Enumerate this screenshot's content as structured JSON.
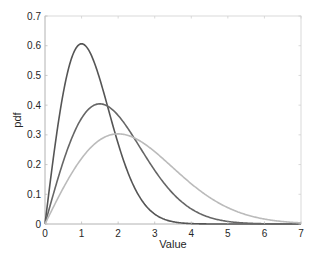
{
  "chart_data": {
    "type": "line",
    "title": "",
    "xlabel": "Value",
    "ylabel": "pdf",
    "xlim": [
      0,
      7
    ],
    "ylim": [
      0,
      0.7
    ],
    "xticks": [
      0,
      1,
      2,
      3,
      4,
      5,
      6,
      7
    ],
    "yticks": [
      0,
      0.1,
      0.2,
      0.3,
      0.4,
      0.5,
      0.6,
      0.7
    ],
    "grid": false,
    "legend": null,
    "series": [
      {
        "name": "Rayleigh b=1",
        "color": "#555555",
        "x": [
          0,
          0.25,
          0.5,
          0.75,
          1.0,
          1.25,
          1.5,
          1.75,
          2.0,
          2.5,
          3.0,
          3.5,
          4.0,
          5.0,
          6.0,
          7.0
        ],
        "values": [
          0,
          0.242,
          0.441,
          0.567,
          0.607,
          0.572,
          0.487,
          0.379,
          0.271,
          0.11,
          0.033,
          0.008,
          0.001,
          0.0,
          0.0,
          0.0
        ]
      },
      {
        "name": "Rayleigh b=1.5",
        "color": "#666666",
        "x": [
          0,
          0.5,
          1.0,
          1.5,
          2.0,
          2.5,
          3.0,
          3.5,
          4.0,
          4.5,
          5.0,
          6.0,
          7.0
        ],
        "values": [
          0,
          0.211,
          0.356,
          0.404,
          0.366,
          0.278,
          0.18,
          0.1,
          0.051,
          0.015,
          0.009,
          0.001,
          0.0
        ]
      },
      {
        "name": "Rayleigh b=2",
        "color": "#bbbbbb",
        "x": [
          0,
          0.5,
          1.0,
          1.5,
          2.0,
          2.5,
          3.0,
          3.5,
          4.0,
          4.5,
          5.0,
          5.5,
          6.0,
          6.5,
          7.0
        ],
        "values": [
          0,
          0.121,
          0.221,
          0.283,
          0.303,
          0.286,
          0.244,
          0.19,
          0.135,
          0.089,
          0.055,
          0.031,
          0.017,
          0.008,
          0.004
        ]
      }
    ]
  }
}
